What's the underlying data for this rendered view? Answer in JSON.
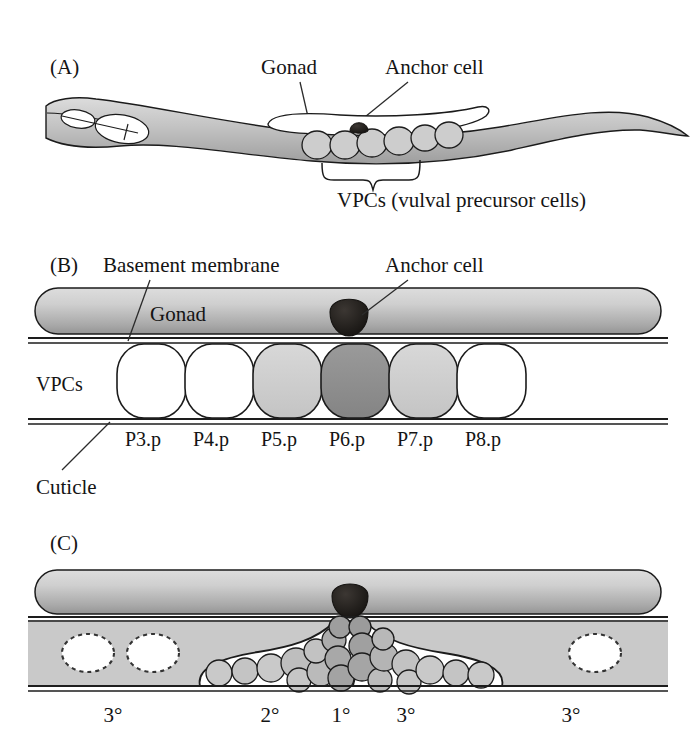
{
  "figure": {
    "background_color": "#ffffff",
    "ink_color": "#141414"
  },
  "palette": {
    "body_gray_light": "#d4d4d4",
    "body_gray_mid": "#b6b6b6",
    "body_gray_dark": "#9a9a9a",
    "gonad_light": "#d9d9d9",
    "gonad_dark": "#9d9d9d",
    "anchor_cell": "#1d1a18",
    "vpc_white": "#ffffff",
    "vpc_light_gray": "#cfcfcf",
    "vpc_dark_gray": "#8f8f8f",
    "band_gray": "#c9c9c9",
    "descendant_light": "#c4c4c4",
    "descendant_mid": "#b0b0b0",
    "descendant_dark": "#9b9b9b",
    "outline": "#1b1b1b"
  },
  "panels": [
    {
      "id": "A",
      "label": "(A)",
      "annotations": [
        {
          "name": "gonad",
          "text": "Gonad"
        },
        {
          "name": "anchor-cell",
          "text": "Anchor cell"
        },
        {
          "name": "vpcs",
          "text": "VPCs (vulval precursor cells)"
        }
      ],
      "vpc_count": 6
    },
    {
      "id": "B",
      "label": "(B)",
      "annotations": [
        {
          "name": "basement-membrane",
          "text": "Basement membrane"
        },
        {
          "name": "anchor-cell",
          "text": "Anchor cell"
        },
        {
          "name": "gonad",
          "text": "Gonad"
        },
        {
          "name": "vpcs",
          "text": "VPCs"
        },
        {
          "name": "cuticle",
          "text": "Cuticle"
        }
      ],
      "cells": [
        {
          "name": "P3.p",
          "label": "P3.p",
          "fill": "#ffffff"
        },
        {
          "name": "P4.p",
          "label": "P4.p",
          "fill": "#ffffff"
        },
        {
          "name": "P5.p",
          "label": "P5.p",
          "fill": "#cfcfcf"
        },
        {
          "name": "P6.p",
          "label": "P6.p",
          "fill": "#8f8f8f"
        },
        {
          "name": "P7.p",
          "label": "P7.p",
          "fill": "#cfcfcf"
        },
        {
          "name": "P8.p",
          "label": "P8.p",
          "fill": "#ffffff"
        }
      ]
    },
    {
      "id": "C",
      "label": "(C)",
      "fates": [
        {
          "name": "fate-tertiary-left-outer",
          "label": "3°",
          "x": 113
        },
        {
          "name": "fate-secondary",
          "label": "2°",
          "x": 270
        },
        {
          "name": "fate-primary",
          "label": "1°",
          "x": 341
        },
        {
          "name": "fate-tertiary-right",
          "label": "3°",
          "x": 406
        },
        {
          "name": "fate-tertiary-right-outer",
          "label": "3°",
          "x": 571
        }
      ],
      "fused_cells": 3
    }
  ]
}
